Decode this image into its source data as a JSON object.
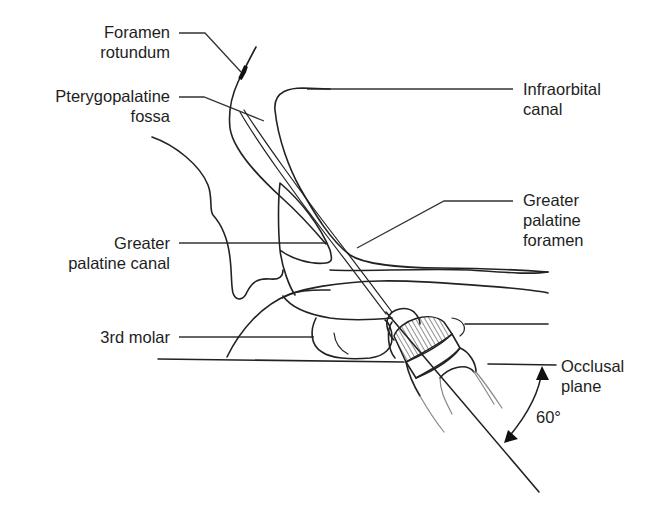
{
  "diagram": {
    "labels": {
      "foramen_rotundum": {
        "line1": "Foramen",
        "line2": "rotundum"
      },
      "pterygopalatine_fossa": {
        "line1": "Pterygopalatine",
        "line2": "fossa"
      },
      "infraorbital_canal": {
        "line1": "Infraorbital",
        "line2": "canal"
      },
      "greater_palatine_foramen": {
        "line1": "Greater",
        "line2": "palatine",
        "line3": "foramen"
      },
      "greater_palatine_canal": {
        "line1": "Greater",
        "line2": "palatine canal"
      },
      "third_molar": {
        "line1": "3rd molar"
      },
      "occlusal_plane": {
        "line1": "Occlusal",
        "line2": "plane"
      },
      "angle": {
        "value": "60°"
      }
    },
    "colors": {
      "line": "#222222",
      "background": "#ffffff",
      "text": "#1e1e1e"
    }
  }
}
